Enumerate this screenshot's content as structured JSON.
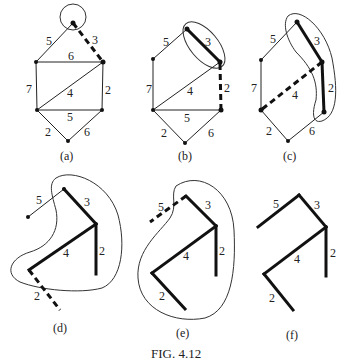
{
  "figure": {
    "title": "FIG. 4.12"
  },
  "panels": [
    {
      "id": "a",
      "caption": "(a)",
      "edge_labels": [
        "5",
        "3",
        "6",
        "7",
        "4",
        "2",
        "5",
        "2",
        "6"
      ]
    },
    {
      "id": "b",
      "caption": "(b)",
      "edge_labels": [
        "5",
        "3",
        "7",
        "4",
        "2",
        "5",
        "2",
        "6"
      ]
    },
    {
      "id": "c",
      "caption": "(c)",
      "edge_labels": [
        "5",
        "3",
        "7",
        "4",
        "2",
        "2",
        "6"
      ]
    },
    {
      "id": "d",
      "caption": "(d)",
      "edge_labels": [
        "5",
        "3",
        "4",
        "2",
        "2"
      ]
    },
    {
      "id": "e",
      "caption": "(e)",
      "edge_labels": [
        "5",
        "3",
        "4",
        "2",
        "2"
      ]
    },
    {
      "id": "f",
      "caption": "(f)",
      "edge_labels": [
        "5",
        "3",
        "2",
        "4",
        "2"
      ]
    }
  ],
  "colors": {
    "ink": "#111111",
    "background": "#ffffff"
  }
}
